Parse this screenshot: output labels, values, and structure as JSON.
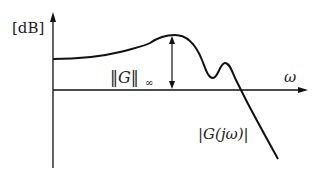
{
  "diagram": {
    "y_unit_label": "[dB]",
    "x_axis_label": "ω",
    "hinf_norm_label": {
      "norm": "‖G‖",
      "sub": "∞"
    },
    "curve_label": "|G(jω)|",
    "colors": {
      "line": "#111111",
      "background": "#ffffff"
    }
  }
}
